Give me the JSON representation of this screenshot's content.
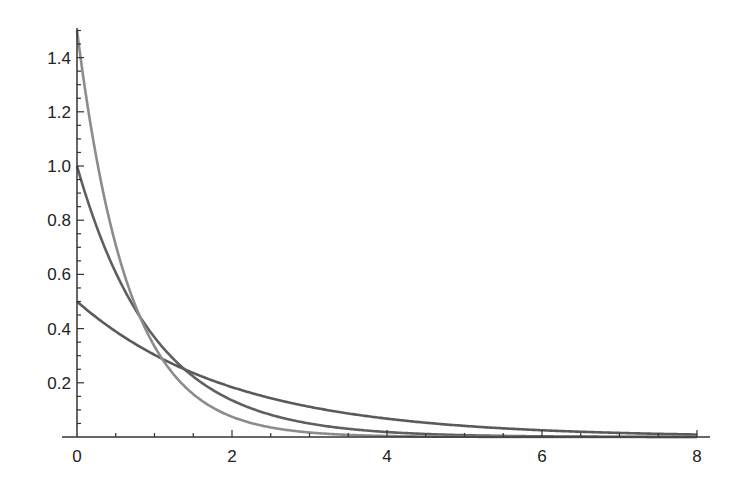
{
  "chart_data": {
    "type": "line",
    "title": "",
    "xlabel": "",
    "ylabel": "",
    "xlim": [
      0,
      8.15
    ],
    "ylim": [
      0,
      1.51
    ],
    "grid": false,
    "legend": null,
    "x_ticks": {
      "major": [
        0,
        2,
        4,
        6,
        8
      ],
      "minor_step": 0.5,
      "labels": [
        "0",
        "2",
        "4",
        "6",
        "8"
      ]
    },
    "y_ticks": {
      "major": [
        0.2,
        0.4,
        0.6,
        0.8,
        1.0,
        1.2,
        1.4
      ],
      "minor_step": 0.05,
      "labels": [
        "0.2",
        "0.4",
        "0.6",
        "0.8",
        "1.0",
        "1.2",
        "1.4"
      ]
    },
    "series": [
      {
        "name": "lambda = 0.5",
        "function": "0.5*exp(-0.5x)",
        "lambda": 0.5,
        "color": "#5a5a5a",
        "x": [
          0,
          1,
          2,
          3,
          4,
          5,
          6,
          7,
          8
        ],
        "values": [
          0.5,
          0.303,
          0.184,
          0.112,
          0.068,
          0.041,
          0.025,
          0.015,
          0.009
        ]
      },
      {
        "name": "lambda = 1.0",
        "function": "1.0*exp(-1.0x)",
        "lambda": 1.0,
        "color": "#5f5f5f",
        "x": [
          0,
          1,
          2,
          3,
          4,
          5,
          6,
          7,
          8
        ],
        "values": [
          1.0,
          0.368,
          0.135,
          0.05,
          0.018,
          0.007,
          0.002,
          0.001,
          0.0003
        ]
      },
      {
        "name": "lambda = 1.5",
        "function": "1.5*exp(-1.5x)",
        "lambda": 1.5,
        "color": "#8c8c8c",
        "x": [
          0,
          1,
          2,
          3,
          4,
          5,
          6,
          7,
          8
        ],
        "values": [
          1.5,
          0.335,
          0.075,
          0.017,
          0.004,
          0.001,
          0.0002,
          0.0,
          0.0
        ]
      }
    ]
  }
}
